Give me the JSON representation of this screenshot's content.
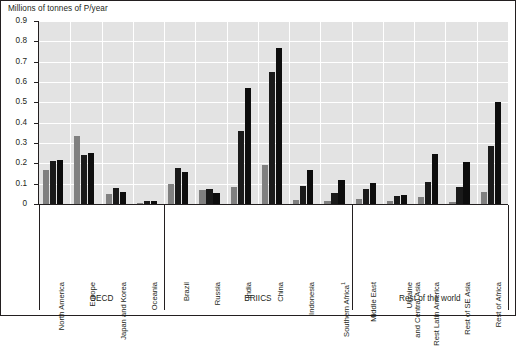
{
  "chart_data": {
    "type": "bar",
    "title": "",
    "ylabel": "Millions of tonnes of P/year",
    "xlabel": "",
    "ylim": [
      0,
      0.9
    ],
    "ytick_labels": [
      "0",
      "0.1",
      "0.2",
      "0.3",
      "0.4",
      "0.5",
      "0.6",
      "0.7",
      "0.8",
      "0.9"
    ],
    "ytick_values": [
      0,
      0.1,
      0.2,
      0.3,
      0.4,
      0.5,
      0.6,
      0.7,
      0.8,
      0.9
    ],
    "grid": true,
    "legend_position": "none",
    "footnote_marker": "1",
    "categories": [
      "North America",
      "Europe",
      "Japan and Korea",
      "Oceania",
      "Brazil",
      "Russia",
      "India",
      "China",
      "Indonesia",
      "Southern Africa",
      "Middle East",
      "Ukraine and Central Asia",
      "Rest Latin America",
      "Rest of SE Asia",
      "Rest of Africa"
    ],
    "category_label_lines": [
      [
        "North America"
      ],
      [
        "Europe"
      ],
      [
        "Japan and Korea"
      ],
      [
        "Oceania"
      ],
      [
        "Brazil"
      ],
      [
        "Russia"
      ],
      [
        "India"
      ],
      [
        "China"
      ],
      [
        "Indonesia"
      ],
      [
        "Southern Africa"
      ],
      [
        "Middle East"
      ],
      [
        "Ukraine",
        "and Central Asia"
      ],
      [
        "Rest Latin America"
      ],
      [
        "Rest of SE Asia"
      ],
      [
        "Rest of Africa"
      ]
    ],
    "series": [
      {
        "name": "series-1",
        "color": "#808080",
        "values": [
          0.165,
          0.335,
          0.05,
          0.005,
          0.1,
          0.07,
          0.085,
          0.19,
          0.02,
          0.015,
          0.025,
          0.015,
          0.035,
          0.01,
          0.06
        ]
      },
      {
        "name": "series-2",
        "color": "#1a1a1a",
        "values": [
          0.21,
          0.24,
          0.08,
          0.015,
          0.175,
          0.075,
          0.36,
          0.65,
          0.09,
          0.055,
          0.075,
          0.04,
          0.11,
          0.085,
          0.285
        ]
      },
      {
        "name": "series-3",
        "color": "#0d0d0d",
        "values": [
          0.215,
          0.25,
          0.06,
          0.015,
          0.155,
          0.055,
          0.57,
          0.765,
          0.165,
          0.12,
          0.105,
          0.045,
          0.245,
          0.205,
          0.5
        ]
      }
    ],
    "groups": [
      {
        "label": "OECD",
        "start": 0,
        "end": 3
      },
      {
        "label": "BRIICS",
        "start": 4,
        "end": 9
      },
      {
        "label": "Rest of the world",
        "start": 10,
        "end": 14
      }
    ]
  }
}
